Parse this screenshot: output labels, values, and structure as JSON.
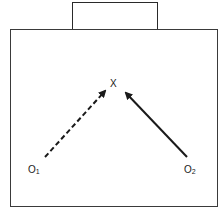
{
  "diagram": {
    "target": {
      "label": "X"
    },
    "observers": [
      {
        "id": "o1",
        "letter": "O",
        "subscript": "1",
        "arrow_style": "dashed"
      },
      {
        "id": "o2",
        "letter": "O",
        "subscript": "2",
        "arrow_style": "solid"
      }
    ],
    "colors": {
      "stroke": "#1a1a1a",
      "background": "#ffffff"
    }
  }
}
